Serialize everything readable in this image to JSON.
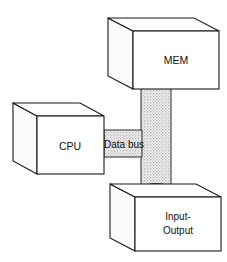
{
  "diagram": {
    "background_color": "#ffffff",
    "line_color": "#1a1a1a",
    "bus_fill_color": "#e8e8e8",
    "bus_texture": "stipple-dots",
    "nodes": [
      {
        "id": "mem",
        "label": "MEM",
        "shape": "isometric-box",
        "position": "top-right"
      },
      {
        "id": "cpu",
        "label": "CPU",
        "shape": "isometric-box",
        "position": "left-middle"
      },
      {
        "id": "io",
        "label_line1": "Input-",
        "label_line2": "Output",
        "shape": "isometric-box",
        "position": "bottom-right"
      }
    ],
    "connector": {
      "id": "data-bus",
      "label": "Data bus",
      "style": "stippled-band",
      "connects": [
        "mem",
        "cpu",
        "io"
      ]
    }
  }
}
